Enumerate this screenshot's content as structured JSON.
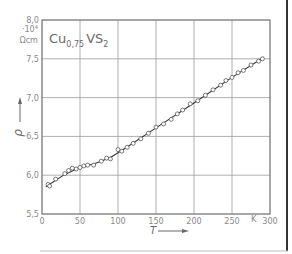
{
  "chart_data": {
    "type": "scatter",
    "title_parts": {
      "base": "Cu",
      "sub1": "0,75",
      "mid": "VS",
      "sub2": "2"
    },
    "xlabel": "T",
    "xunit": "K",
    "ylabel": "ρ",
    "yunit_line1": "·10⁴",
    "yunit_line2": "Ωcm",
    "xlim": [
      0,
      300
    ],
    "ylim": [
      5.5,
      8.0
    ],
    "xticks": [
      0,
      50,
      100,
      150,
      200,
      250,
      300
    ],
    "xtick_labels": [
      "0",
      "50",
      "100",
      "150",
      "200",
      "250",
      "300"
    ],
    "yticks": [
      5.5,
      6.0,
      6.5,
      7.0,
      7.5,
      8.0
    ],
    "ytick_labels": [
      "5,5",
      "6,0",
      "6,5",
      "7,0",
      "7,5",
      "8,0"
    ],
    "grid": true,
    "legend": null,
    "series": [
      {
        "name": "measured",
        "marker": "open-circle",
        "x": [
          8,
          10,
          18,
          30,
          35,
          40,
          45,
          50,
          55,
          60,
          68,
          78,
          85,
          90,
          100,
          105,
          112,
          120,
          130,
          140,
          150,
          160,
          170,
          178,
          185,
          195,
          205,
          215,
          225,
          235,
          242,
          250,
          258,
          265,
          275,
          285,
          290
        ],
        "y": [
          5.88,
          5.86,
          5.95,
          6.02,
          6.06,
          6.09,
          6.08,
          6.1,
          6.12,
          6.13,
          6.13,
          6.18,
          6.22,
          6.21,
          6.33,
          6.31,
          6.36,
          6.41,
          6.47,
          6.54,
          6.62,
          6.66,
          6.72,
          6.79,
          6.84,
          6.92,
          6.96,
          7.03,
          7.1,
          7.16,
          7.22,
          7.26,
          7.32,
          7.35,
          7.42,
          7.47,
          7.5
        ]
      },
      {
        "name": "fit",
        "type": "line",
        "x": [
          5,
          30,
          50,
          70,
          90,
          110,
          150,
          200,
          250,
          292
        ],
        "y": [
          5.85,
          6.01,
          6.1,
          6.15,
          6.23,
          6.35,
          6.61,
          6.93,
          7.26,
          7.52
        ]
      }
    ]
  }
}
